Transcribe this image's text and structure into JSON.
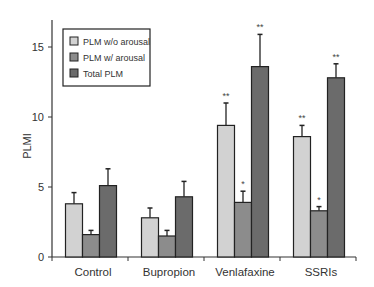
{
  "chart_data": {
    "type": "bar",
    "title": "",
    "xlabel": "",
    "ylabel": "PLMI",
    "ylim": [
      0,
      16.5
    ],
    "yticks": [
      0,
      5,
      10,
      15
    ],
    "categories": [
      "Control",
      "Bupropion",
      "Venlafaxine",
      "SSRIs"
    ],
    "series": [
      {
        "name": "PLM w/o arousal",
        "color": "#d2d2d2",
        "values": [
          3.8,
          2.8,
          9.4,
          8.6
        ],
        "error_upper": [
          4.6,
          3.5,
          11.0,
          9.4
        ],
        "significance": [
          "",
          "",
          "**",
          "**"
        ]
      },
      {
        "name": "PLM w/ arousal",
        "color": "#8c8c8c",
        "values": [
          1.6,
          1.5,
          3.9,
          3.3
        ],
        "error_upper": [
          1.9,
          1.9,
          4.7,
          3.6
        ],
        "significance": [
          "",
          "",
          "*",
          "*"
        ]
      },
      {
        "name": "Total PLM",
        "color": "#6b6b6b",
        "values": [
          5.1,
          4.3,
          13.6,
          12.8
        ],
        "error_upper": [
          6.3,
          5.4,
          15.9,
          13.8
        ],
        "significance": [
          "",
          "",
          "**",
          "**"
        ]
      }
    ],
    "legend_position": "upper-left",
    "grid": false
  }
}
